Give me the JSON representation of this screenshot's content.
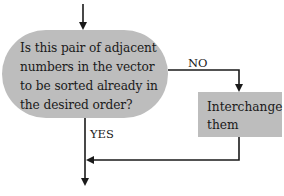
{
  "diagram": {
    "type": "flowchart",
    "nodes": {
      "decision": {
        "shape": "rounded-pill",
        "lines": [
          "Is this pair of adjacent",
          "numbers in the vector",
          "to be sorted already in",
          "the desired order?"
        ]
      },
      "process": {
        "shape": "rectangle",
        "lines": [
          "Interchange",
          "them"
        ]
      }
    },
    "edges": {
      "no_label": "NO",
      "yes_label": "YES"
    },
    "colors": {
      "node_fill": "#bdbdbd",
      "line": "#1a1a1a",
      "background": "#ffffff"
    }
  }
}
